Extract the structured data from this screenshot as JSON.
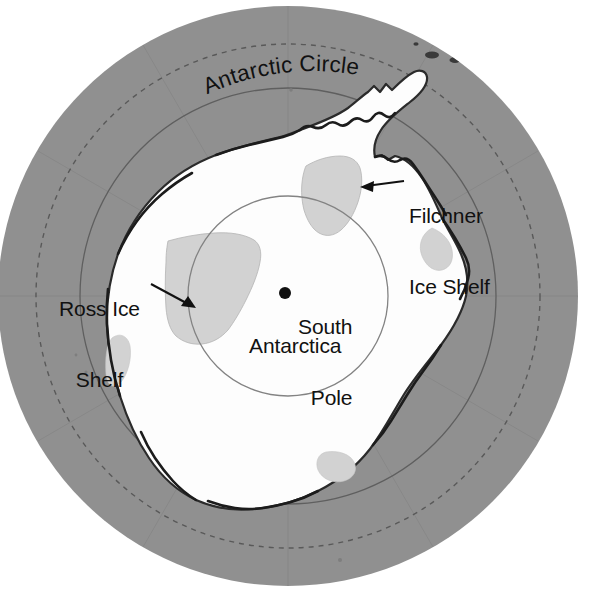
{
  "map": {
    "title": "Antarctica polar projection map",
    "center_label": "Antarctica",
    "pole_marker_label": "South Pole",
    "curved_label": "Antarctic Circle",
    "labels": {
      "antarctic_circle": "Antarctic Circle",
      "filchner_line1": "Filchner",
      "filchner_line2": "Ice Shelf",
      "ross_line1": "Ross Ice",
      "ross_line2": "Shelf",
      "south_pole_line1": "South",
      "south_pole_line2": "Pole",
      "antarctica": "Antarctica"
    },
    "colors": {
      "ocean": "#919191",
      "ice_sheet": "#ffffff",
      "ice_shelf": "#d2d2d2",
      "coastline": "#1a1a1a",
      "graticule": "#6a6a6a",
      "label_text": "#111111",
      "page_background": "#ffffff",
      "pole_dot": "#111111"
    },
    "geometry": {
      "center_x": 288,
      "center_y": 296,
      "outer_radius": 290,
      "antarctic_circle_radius": 252,
      "latitude_70_radius": 208,
      "latitude_80_radius": 100,
      "pole_dot_x": 285,
      "pole_dot_y": 293,
      "pole_dot_radius": 6
    }
  }
}
